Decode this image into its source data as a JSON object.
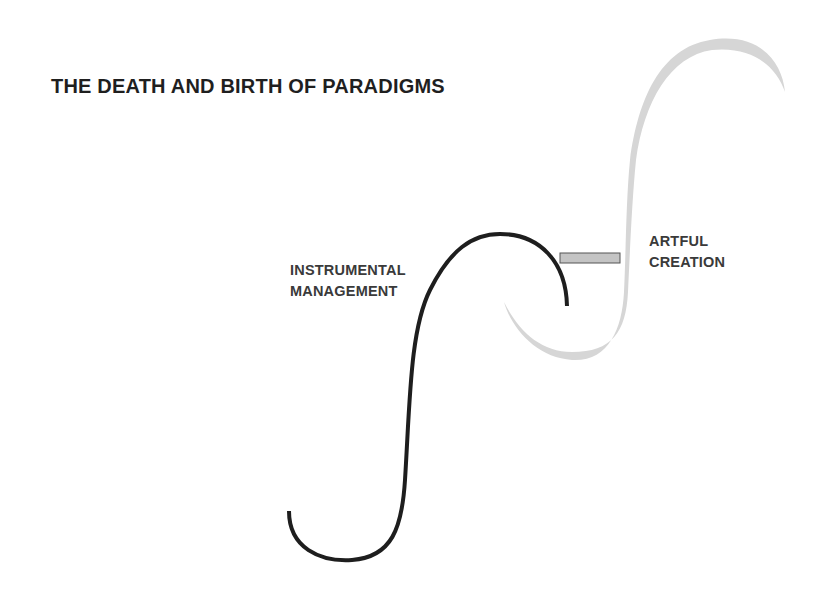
{
  "title": "THE DEATH AND BIRTH OF PARADIGMS",
  "labels": {
    "instrumental": {
      "line1": "INSTRUMENTAL",
      "line2": "MANAGEMENT"
    },
    "artful": {
      "line1": "ARTFUL",
      "line2": "CREATION"
    }
  },
  "colors": {
    "background": "#ffffff",
    "title": "#1f1f1f",
    "label": "#3a3a3a",
    "instrumental_curve": "#1e1e1e",
    "artful_curve": "#d6d6d6",
    "bridge_fill": "#c4c4c4",
    "bridge_stroke": "#555555"
  },
  "curves": [
    {
      "name": "Instrumental Management",
      "shape": "S-curve",
      "style": "solid black"
    },
    {
      "name": "Artful Creation",
      "shape": "S-curve",
      "style": "light gray tapered"
    }
  ]
}
